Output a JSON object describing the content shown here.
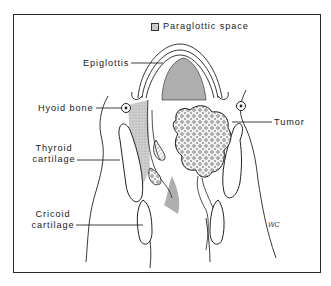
{
  "figure": {
    "type": "anatomical-line-illustration",
    "legend": {
      "swatch_pattern": "stippled-gray",
      "label": "Paraglottic space"
    },
    "labels": {
      "epiglottis": "Epiglottis",
      "hyoid_bone": "Hyoid bone",
      "thyroid_cartilage_line1": "Thyroid",
      "thyroid_cartilage_line2": "cartilage",
      "cricoid_cartilage_line1": "Cricoid",
      "cricoid_cartilage_line2": "cartilage",
      "tumor": "Tumor"
    },
    "signature": "WC",
    "colors": {
      "ink": "#1a1a1a",
      "background": "#ffffff",
      "shading": "#bdbdbd"
    }
  }
}
